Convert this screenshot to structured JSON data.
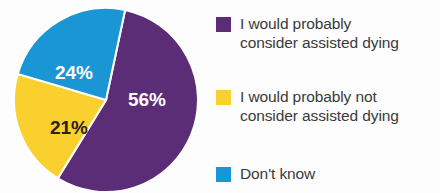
{
  "chart_data": {
    "type": "pie",
    "title": "",
    "subtitle": "",
    "xlabel": "",
    "ylabel": "",
    "grid": false,
    "legend_position": "right",
    "units": "percent",
    "categories": [
      "I would probably consider assisted dying",
      "I would probably not consider assisted dying",
      "Don't know"
    ],
    "values": [
      56,
      21,
      24
    ],
    "data_labels": [
      "56%",
      "21%",
      "24%"
    ],
    "colors": [
      "#5b2d76",
      "#fad02e",
      "#1b96d4"
    ],
    "label_text_colors": [
      "#ffffff",
      "#2b2111",
      "#ffffff"
    ],
    "slices": [
      {
        "name": "I would probably consider assisted dying",
        "value": 56,
        "label": "56%",
        "color": "#5b2d76",
        "label_color": "#ffffff",
        "start_angle_deg": 12,
        "end_angle_deg": 213.6
      },
      {
        "name": "I would probably not consider assisted dying",
        "value": 21,
        "label": "21%",
        "color": "#fad02e",
        "label_color": "#2b2111",
        "start_angle_deg": 213.6,
        "end_angle_deg": 289.2
      },
      {
        "name": "Don't know",
        "value": 24,
        "label": "24%",
        "color": "#1b96d4",
        "label_color": "#ffffff",
        "start_angle_deg": 289.2,
        "end_angle_deg": 372
      }
    ]
  },
  "legend": {
    "items": [
      {
        "label": "I would probably\nconsider assisted dying",
        "color": "#5b2d76",
        "swatch_name": "legend-swatch-purple"
      },
      {
        "label": "I would probably not\nconsider assisted dying",
        "color": "#fad02e",
        "swatch_name": "legend-swatch-yellow"
      },
      {
        "label": "Don't know",
        "color": "#1b96d4",
        "swatch_name": "legend-swatch-blue"
      }
    ]
  },
  "pie": {
    "labels": {
      "purple": "56%",
      "yellow": "21%",
      "blue": "24%"
    }
  },
  "colors": {
    "purple": "#5b2d76",
    "yellow": "#fad02e",
    "blue": "#1b96d4",
    "separator": "#ffffff",
    "legend_text": "#3a3a3a",
    "background": "#fdfdfd"
  }
}
